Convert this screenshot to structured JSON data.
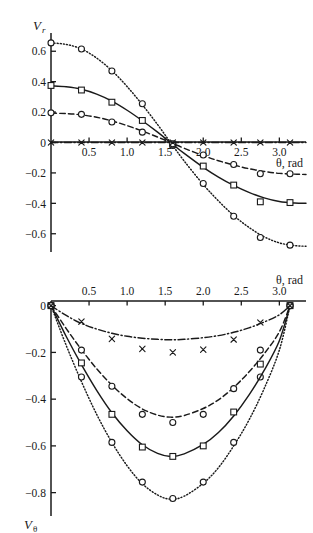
{
  "figure": {
    "background": "#ffffff",
    "ink": "#1a1a1a"
  },
  "chart_data": [
    {
      "id": "panel-top",
      "type": "line",
      "title": "",
      "xlabel": "θ, rad",
      "ylabel": "V",
      "ylabel_sub": "r",
      "xlim": [
        0.0,
        3.35
      ],
      "ylim": [
        -0.72,
        0.72
      ],
      "xticks": [
        0.5,
        1.0,
        1.5,
        2.0,
        2.5,
        3.0
      ],
      "xticklabels": [
        "0.5",
        "1.0",
        "1.5",
        "2.0",
        "2.5",
        "3.0"
      ],
      "yticks": [
        0.6,
        0.4,
        0.2,
        0,
        -0.2,
        -0.4,
        -0.6
      ],
      "yticklabels": [
        "0.6",
        "0.4",
        "0.2",
        "0",
        "−0.2",
        "−0.4",
        "−0.6"
      ],
      "grid": false,
      "legend": "none",
      "axis_style": "zero-crossing-spine",
      "series": [
        {
          "name": "dotted-circle",
          "style": "dotted",
          "marker": "circle",
          "x": [
            0.0,
            0.4,
            0.8,
            1.2,
            1.6,
            2.0,
            2.4,
            2.75,
            3.14
          ],
          "y": [
            0.655,
            0.615,
            0.47,
            0.255,
            -0.02,
            -0.27,
            -0.485,
            -0.625,
            -0.675
          ],
          "curve": [
            [
              0.0,
              0.655
            ],
            [
              0.2,
              0.645
            ],
            [
              0.4,
              0.615
            ],
            [
              0.6,
              0.555
            ],
            [
              0.8,
              0.472
            ],
            [
              1.0,
              0.368
            ],
            [
              1.2,
              0.248
            ],
            [
              1.4,
              0.118
            ],
            [
              1.57,
              0.0
            ],
            [
              1.75,
              -0.122
            ],
            [
              2.0,
              -0.276
            ],
            [
              2.2,
              -0.384
            ],
            [
              2.4,
              -0.48
            ],
            [
              2.6,
              -0.558
            ],
            [
              2.8,
              -0.62
            ],
            [
              3.0,
              -0.66
            ],
            [
              3.2,
              -0.678
            ],
            [
              3.35,
              -0.682
            ]
          ]
        },
        {
          "name": "solid-square",
          "style": "solid",
          "marker": "square",
          "x": [
            0.0,
            0.4,
            0.8,
            1.2,
            1.6,
            2.0,
            2.4,
            2.75,
            3.14
          ],
          "y": [
            0.375,
            0.345,
            0.265,
            0.145,
            -0.012,
            -0.155,
            -0.28,
            -0.39,
            -0.395
          ],
          "curve": [
            [
              0.0,
              0.372
            ],
            [
              0.2,
              0.366
            ],
            [
              0.4,
              0.35
            ],
            [
              0.6,
              0.318
            ],
            [
              0.8,
              0.272
            ],
            [
              1.0,
              0.212
            ],
            [
              1.2,
              0.143
            ],
            [
              1.4,
              0.068
            ],
            [
              1.57,
              0.0
            ],
            [
              1.75,
              -0.072
            ],
            [
              2.0,
              -0.163
            ],
            [
              2.2,
              -0.227
            ],
            [
              2.4,
              -0.282
            ],
            [
              2.6,
              -0.328
            ],
            [
              2.8,
              -0.364
            ],
            [
              3.0,
              -0.388
            ],
            [
              3.2,
              -0.398
            ],
            [
              3.35,
              -0.4
            ]
          ]
        },
        {
          "name": "dashed-circle",
          "style": "dashed",
          "marker": "circle",
          "x": [
            0.0,
            0.4,
            0.8,
            1.2,
            1.6,
            2.0,
            2.4,
            2.75,
            3.14
          ],
          "y": [
            0.195,
            0.185,
            0.135,
            0.068,
            -0.008,
            -0.082,
            -0.145,
            -0.205,
            -0.205
          ],
          "curve": [
            [
              0.0,
              0.193
            ],
            [
              0.2,
              0.19
            ],
            [
              0.4,
              0.182
            ],
            [
              0.6,
              0.166
            ],
            [
              0.8,
              0.142
            ],
            [
              1.0,
              0.111
            ],
            [
              1.2,
              0.075
            ],
            [
              1.4,
              0.036
            ],
            [
              1.57,
              0.0
            ],
            [
              1.75,
              -0.038
            ],
            [
              2.0,
              -0.086
            ],
            [
              2.2,
              -0.12
            ],
            [
              2.4,
              -0.148
            ],
            [
              2.6,
              -0.172
            ],
            [
              2.8,
              -0.19
            ],
            [
              3.0,
              -0.203
            ],
            [
              3.2,
              -0.208
            ],
            [
              3.35,
              -0.21
            ]
          ]
        },
        {
          "name": "dashdot-cross",
          "style": "dashdot",
          "marker": "cross",
          "x": [
            0.0,
            0.4,
            0.8,
            1.2,
            1.6,
            2.0,
            2.4,
            2.75,
            3.14
          ],
          "y": [
            0.0,
            0.0,
            0.0,
            0.0,
            0.0,
            0.0,
            0.0,
            0.0,
            0.0
          ],
          "curve": [
            [
              0.0,
              0.0
            ],
            [
              3.35,
              0.0
            ]
          ]
        }
      ]
    },
    {
      "id": "panel-bottom",
      "type": "line",
      "title": "",
      "xlabel": "θ, rad",
      "ylabel": "V",
      "ylabel_sub": "θ",
      "xlim": [
        0.0,
        3.35
      ],
      "ylim": [
        -0.9,
        0.02
      ],
      "xticks": [
        0.5,
        1.0,
        1.5,
        2.0,
        2.5,
        3.0
      ],
      "xticklabels": [
        "0.5",
        "1.0",
        "1.5",
        "2.0",
        "2.5",
        "3.0"
      ],
      "yticks": [
        0,
        -0.2,
        -0.4,
        -0.6,
        -0.8
      ],
      "yticklabels": [
        "0",
        "−0.2",
        "−0.4",
        "−0.6",
        "−0.8"
      ],
      "grid": false,
      "legend": "none",
      "axis_style": "top-axis",
      "series": [
        {
          "name": "dotted-circle",
          "style": "dotted",
          "marker": "circle",
          "x": [
            0.0,
            0.4,
            0.8,
            1.2,
            1.6,
            2.0,
            2.4,
            2.75,
            3.14
          ],
          "y": [
            0.0,
            -0.305,
            -0.585,
            -0.755,
            -0.825,
            -0.755,
            -0.585,
            -0.305,
            0.0
          ],
          "curve": [
            [
              0.0,
              0.0
            ],
            [
              0.2,
              -0.17
            ],
            [
              0.4,
              -0.325
            ],
            [
              0.6,
              -0.465
            ],
            [
              0.8,
              -0.585
            ],
            [
              1.0,
              -0.685
            ],
            [
              1.2,
              -0.762
            ],
            [
              1.4,
              -0.81
            ],
            [
              1.57,
              -0.828
            ],
            [
              1.75,
              -0.815
            ],
            [
              2.0,
              -0.76
            ],
            [
              2.2,
              -0.693
            ],
            [
              2.4,
              -0.6
            ],
            [
              2.6,
              -0.49
            ],
            [
              2.8,
              -0.355
            ],
            [
              3.0,
              -0.19
            ],
            [
              3.14,
              0.0
            ]
          ]
        },
        {
          "name": "solid-square",
          "style": "solid",
          "marker": "square",
          "x": [
            0.0,
            0.4,
            0.8,
            1.2,
            1.6,
            2.0,
            2.4,
            2.75,
            3.14
          ],
          "y": [
            0.0,
            -0.245,
            -0.465,
            -0.605,
            -0.645,
            -0.6,
            -0.455,
            -0.25,
            0.0
          ],
          "curve": [
            [
              0.0,
              0.0
            ],
            [
              0.2,
              -0.132
            ],
            [
              0.4,
              -0.252
            ],
            [
              0.6,
              -0.362
            ],
            [
              0.8,
              -0.458
            ],
            [
              1.0,
              -0.535
            ],
            [
              1.2,
              -0.595
            ],
            [
              1.4,
              -0.632
            ],
            [
              1.57,
              -0.645
            ],
            [
              1.75,
              -0.634
            ],
            [
              2.0,
              -0.594
            ],
            [
              2.2,
              -0.543
            ],
            [
              2.4,
              -0.472
            ],
            [
              2.6,
              -0.383
            ],
            [
              2.8,
              -0.277
            ],
            [
              3.0,
              -0.15
            ],
            [
              3.14,
              0.0
            ]
          ]
        },
        {
          "name": "dashed-circle",
          "style": "dashed",
          "marker": "circle",
          "x": [
            0.0,
            0.4,
            0.8,
            1.2,
            1.6,
            2.0,
            2.4,
            2.75,
            3.14
          ],
          "y": [
            0.0,
            -0.19,
            -0.345,
            -0.465,
            -0.5,
            -0.465,
            -0.355,
            -0.19,
            0.0
          ],
          "curve": [
            [
              0.0,
              0.0
            ],
            [
              0.2,
              -0.098
            ],
            [
              0.4,
              -0.188
            ],
            [
              0.6,
              -0.27
            ],
            [
              0.8,
              -0.34
            ],
            [
              1.0,
              -0.398
            ],
            [
              1.2,
              -0.442
            ],
            [
              1.4,
              -0.468
            ],
            [
              1.57,
              -0.477
            ],
            [
              1.75,
              -0.47
            ],
            [
              2.0,
              -0.44
            ],
            [
              2.2,
              -0.403
            ],
            [
              2.4,
              -0.35
            ],
            [
              2.6,
              -0.284
            ],
            [
              2.8,
              -0.206
            ],
            [
              3.0,
              -0.112
            ],
            [
              3.14,
              0.0
            ]
          ]
        },
        {
          "name": "dashdot-cross",
          "style": "dashdot",
          "marker": "cross",
          "x": [
            0.0,
            0.4,
            0.8,
            1.2,
            1.6,
            2.0,
            2.4,
            2.75,
            3.14
          ],
          "y": [
            0.0,
            -0.068,
            -0.142,
            -0.185,
            -0.2,
            -0.188,
            -0.145,
            -0.072,
            0.0
          ],
          "curve": [
            [
              0.0,
              0.0
            ],
            [
              0.2,
              -0.042
            ],
            [
              0.4,
              -0.076
            ],
            [
              0.6,
              -0.1
            ],
            [
              0.8,
              -0.118
            ],
            [
              1.0,
              -0.131
            ],
            [
              1.2,
              -0.139
            ],
            [
              1.4,
              -0.144
            ],
            [
              1.57,
              -0.146
            ],
            [
              1.75,
              -0.144
            ],
            [
              2.0,
              -0.137
            ],
            [
              2.2,
              -0.128
            ],
            [
              2.4,
              -0.114
            ],
            [
              2.6,
              -0.095
            ],
            [
              2.8,
              -0.07
            ],
            [
              3.0,
              -0.039
            ],
            [
              3.14,
              0.0
            ]
          ]
        }
      ]
    }
  ]
}
